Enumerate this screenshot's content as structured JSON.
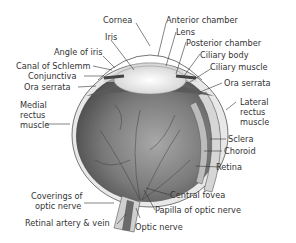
{
  "diagram": {
    "title": "",
    "labels": {
      "cornea": "Cornea",
      "iris": "Iris",
      "angle_of_iris": "Angle of iris",
      "canal_of_schlemm": "Canal of Schlemm",
      "conjunctiva": "Conjunctiva",
      "ora_serrata_left": "Ora serrata",
      "medial_rectus_1": "Medial",
      "medial_rectus_2": "rectus",
      "medial_rectus_3": "muscle",
      "anterior_chamber": "Anterior chamber",
      "lens": "Lens",
      "posterior_chamber": "Posterior chamber",
      "ciliary_body": "Ciliary body",
      "ciliary_muscle": "Ciliary muscle",
      "ora_serrata_right": "Ora serrata",
      "lateral_rectus_1": "Lateral",
      "lateral_rectus_2": "rectus",
      "lateral_rectus_3": "muscle",
      "sclera": "Sclera",
      "choroid": "Choroid",
      "retina": "Retina",
      "central_fovea": "Central fovea",
      "papilla": "Papilla of optic nerve",
      "optic_nerve": "Optic nerve",
      "coverings_1": "Coverings of",
      "coverings_2": "optic nerve",
      "retinal_vessels": "Retinal artery & vein"
    },
    "colors": {
      "eyeball": "#6e6e6e",
      "eyeball_light": "#b5b5b5",
      "lens": "#f2f2f2",
      "line": "#333333"
    }
  }
}
